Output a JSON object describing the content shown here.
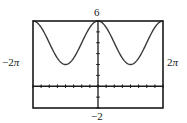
{
  "chart_data": {
    "type": "line",
    "title": "",
    "function": "y = 4 + 2cos(x)",
    "xlabel": "",
    "ylabel": "",
    "xlim": [
      -6.2832,
      6.2832
    ],
    "ylim": [
      -2,
      6
    ],
    "xscale_ticks": 0.7854,
    "yscale_ticks": 1,
    "grid": false,
    "legend": null,
    "window_labels": {
      "xmin": "−2π",
      "xmax": "2π",
      "ymin": "−2",
      "ymax": "6"
    },
    "series": [
      {
        "name": "f(x)",
        "x": [
          -6.2832,
          -4.7124,
          -3.1416,
          -1.5708,
          0,
          1.5708,
          3.1416,
          4.7124,
          6.2832
        ],
        "values": [
          6,
          4,
          2,
          4,
          6,
          4,
          2,
          4,
          6
        ]
      }
    ],
    "colors": {
      "curve": "#3a3a3a",
      "frame": "#1a1a1a",
      "axes": "#1a1a1a"
    }
  },
  "labels": {
    "ymax": "6",
    "ymin": "−2",
    "xmin_sign": "−2",
    "xmin_pi": "π",
    "xmax_num": "2",
    "xmax_pi": "π"
  }
}
